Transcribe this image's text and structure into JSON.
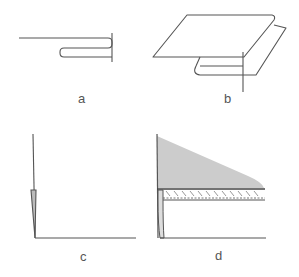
{
  "figure": {
    "panels": [
      {
        "id": "a",
        "label": "a",
        "description": "Side view of folded edge: single sheet with hem folded underneath, vertical reference line at fold"
      },
      {
        "id": "b",
        "label": "b",
        "description": "Perspective view of sheet with folded hem underneath, vertical reference line at fold"
      },
      {
        "id": "c",
        "label": "c",
        "description": "L-shaped profile with thin tapered shaded flange at bottom of vertical edge"
      },
      {
        "id": "d",
        "label": "d",
        "description": "L-shaped profile with gray tapered fill region above a hatched double-line layer"
      }
    ],
    "colors": {
      "line": "#555555",
      "fill_gray": "#cccccc",
      "flange_fill": "#bbbbbb",
      "label": "#555555",
      "background": "#ffffff"
    }
  }
}
